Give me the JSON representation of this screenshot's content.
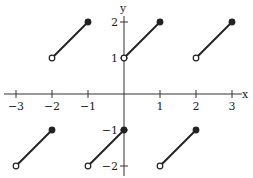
{
  "chart_data": {
    "type": "line",
    "title": "",
    "xlabel": "x",
    "ylabel": "y",
    "xlim": [
      -3,
      3
    ],
    "ylim": [
      -2,
      2
    ],
    "grid": false,
    "x_ticks": [
      -3,
      -2,
      -1,
      1,
      2,
      3
    ],
    "x_tick_labels": [
      "−3",
      "−2",
      "−1",
      "1",
      "2",
      "3"
    ],
    "y_ticks": [
      2,
      1,
      -1,
      -2
    ],
    "y_tick_labels": [
      "2",
      "1",
      "−1",
      "−2"
    ],
    "segments": [
      {
        "x": [
          -3,
          -2
        ],
        "y": [
          -2,
          -1
        ],
        "start": "open",
        "end": "closed"
      },
      {
        "x": [
          -2,
          -1
        ],
        "y": [
          1,
          2
        ],
        "start": "open",
        "end": "closed"
      },
      {
        "x": [
          -1,
          0
        ],
        "y": [
          -2,
          -1
        ],
        "start": "open",
        "end": "closed"
      },
      {
        "x": [
          0,
          1
        ],
        "y": [
          1,
          2
        ],
        "start": "open",
        "end": "closed"
      },
      {
        "x": [
          1,
          2
        ],
        "y": [
          -2,
          -1
        ],
        "start": "open",
        "end": "closed"
      },
      {
        "x": [
          2,
          3
        ],
        "y": [
          1,
          2
        ],
        "start": "open",
        "end": "closed"
      }
    ]
  }
}
